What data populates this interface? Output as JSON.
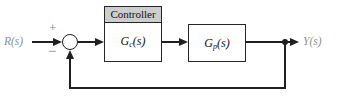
{
  "diagram": {
    "input_label": "R(s)",
    "output_label": "Y(s)",
    "summing_junction": {
      "top_sign": "+",
      "bottom_sign": "−"
    },
    "controller": {
      "header": "Controller",
      "tf_main": "G",
      "tf_sub": "c",
      "tf_args": "(s)"
    },
    "plant": {
      "tf_main": "G",
      "tf_sub": "p",
      "tf_args": "(s)"
    },
    "colors": {
      "line": "#1f1f1f",
      "controller_header_bg": "#cdcdcd",
      "signal_label_gray": "#8e8e8e",
      "sign_gray": "#7d7d7d"
    }
  }
}
